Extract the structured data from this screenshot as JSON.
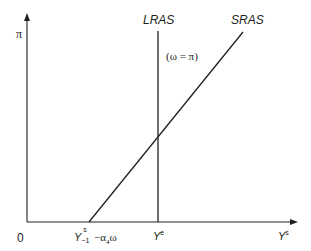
{
  "diagram": {
    "type": "economics-aggregate-supply",
    "y_axis": {
      "label": "π"
    },
    "x_axis": {
      "label_base": "Y",
      "label_sup": "s"
    },
    "origin_label": "0",
    "curves": [
      {
        "id": "lras",
        "label": "LRAS",
        "kind": "vertical",
        "annotation": "(ω = π)"
      },
      {
        "id": "sras",
        "label": "SRAS",
        "kind": "upward-sloping"
      }
    ],
    "x_ticks": {
      "sras_intercept": {
        "base": "Y",
        "sub": "−1",
        "sup": "s",
        "suffix": " −α",
        "suffix_sub": "4",
        "suffix_tail": "ω"
      },
      "equilibrium": {
        "base": "Y",
        "sup": "e"
      }
    },
    "colors": {
      "line": "#231f20",
      "background": "#ffffff"
    }
  }
}
